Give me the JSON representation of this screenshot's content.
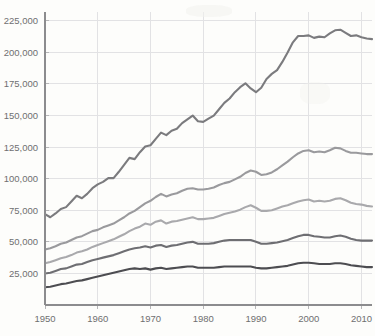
{
  "chart_data": {
    "type": "line",
    "title": "",
    "subtitle": "",
    "xlabel": "",
    "ylabel": "",
    "xlim": [
      1950,
      2012
    ],
    "ylim": [
      0,
      232000
    ],
    "grid": true,
    "legend": "none",
    "xticks": [
      1950,
      1960,
      1970,
      1980,
      1990,
      2000,
      2010
    ],
    "xticklabels": [
      "1950",
      "1960",
      "1970",
      "1980",
      "1990",
      "2000",
      "2010"
    ],
    "yticks": [
      25000,
      50000,
      75000,
      100000,
      125000,
      150000,
      175000,
      200000,
      225000
    ],
    "yticklabels": [
      "25,000",
      "50,000",
      "75,000",
      "100,000",
      "125,000",
      "150,000",
      "175,000",
      "200,000",
      "225,000"
    ],
    "x": [
      1950,
      1951,
      1952,
      1953,
      1954,
      1955,
      1956,
      1957,
      1958,
      1959,
      1960,
      1961,
      1962,
      1963,
      1964,
      1965,
      1966,
      1967,
      1968,
      1969,
      1970,
      1971,
      1972,
      1973,
      1974,
      1975,
      1976,
      1977,
      1978,
      1979,
      1980,
      1981,
      1982,
      1983,
      1984,
      1985,
      1986,
      1987,
      1988,
      1989,
      1990,
      1991,
      1992,
      1993,
      1994,
      1995,
      1996,
      1997,
      1998,
      1999,
      2000,
      2001,
      2002,
      2003,
      2004,
      2005,
      2006,
      2007,
      2008,
      2009,
      2010,
      2011,
      2012
    ],
    "series": [
      {
        "name": "series-1",
        "color": "#7b7b7e",
        "values": [
          72000,
          69500,
          72500,
          76000,
          77500,
          82000,
          86500,
          84500,
          88000,
          92500,
          95500,
          97500,
          100500,
          100500,
          105500,
          111000,
          116500,
          115500,
          121000,
          125500,
          126500,
          131500,
          136500,
          134500,
          138000,
          139500,
          144000,
          147000,
          150000,
          145500,
          145000,
          147500,
          150000,
          155000,
          160000,
          163500,
          168500,
          172500,
          175500,
          171500,
          168500,
          172000,
          179000,
          183000,
          186000,
          192500,
          200000,
          208000,
          213000,
          213000,
          213500,
          211500,
          212500,
          212000,
          215000,
          217500,
          218000,
          215500,
          213000,
          213500,
          212000,
          211000,
          210500
        ]
      },
      {
        "name": "series-2",
        "color": "#9a9a9d",
        "values": [
          44000,
          45000,
          46500,
          48500,
          49500,
          51500,
          53500,
          54500,
          56500,
          58500,
          59500,
          61500,
          63000,
          64500,
          67000,
          69500,
          72500,
          74500,
          77500,
          80500,
          82500,
          85500,
          88000,
          86000,
          87500,
          88500,
          90500,
          92000,
          92500,
          91500,
          91500,
          92000,
          93000,
          95000,
          96500,
          97500,
          99500,
          101500,
          104500,
          106500,
          105500,
          103000,
          103500,
          105000,
          107500,
          110500,
          113500,
          117000,
          120000,
          122000,
          122500,
          121000,
          121500,
          121000,
          122500,
          124500,
          124000,
          122000,
          120500,
          120500,
          120000,
          119500,
          119500
        ]
      },
      {
        "name": "series-3",
        "color": "#a9a9ac",
        "values": [
          33000,
          34000,
          35500,
          37000,
          38000,
          39500,
          41500,
          42500,
          44000,
          46000,
          47500,
          49000,
          50500,
          52000,
          54000,
          56000,
          58500,
          60500,
          62000,
          64500,
          63500,
          66000,
          67000,
          64500,
          66000,
          66500,
          67500,
          68500,
          69500,
          68000,
          68000,
          68500,
          69000,
          70500,
          72000,
          73000,
          74000,
          75500,
          77500,
          79000,
          77000,
          74500,
          74500,
          75000,
          76500,
          78000,
          79000,
          80500,
          82000,
          83000,
          83500,
          82000,
          82500,
          82000,
          82500,
          84000,
          84500,
          83000,
          81000,
          80000,
          79500,
          78500,
          78000
        ]
      },
      {
        "name": "series-4",
        "color": "#6e6e72",
        "values": [
          25000,
          25500,
          27000,
          28500,
          29000,
          30500,
          32000,
          32500,
          34000,
          35500,
          36500,
          37500,
          38500,
          39500,
          41000,
          42500,
          44000,
          45000,
          45500,
          46500,
          45500,
          47000,
          47500,
          46000,
          47000,
          47500,
          48500,
          49500,
          50000,
          48500,
          48500,
          48500,
          49000,
          50000,
          51000,
          51500,
          51500,
          51500,
          51500,
          51500,
          50000,
          48500,
          48500,
          49000,
          49500,
          50500,
          51500,
          53000,
          54500,
          55500,
          55500,
          54500,
          54000,
          53500,
          53500,
          54500,
          55000,
          54000,
          52500,
          51500,
          51000,
          51000,
          51000
        ]
      },
      {
        "name": "series-5",
        "color": "#4d4d51",
        "values": [
          14000,
          14500,
          15500,
          16500,
          17000,
          18000,
          19000,
          19500,
          20500,
          21500,
          22500,
          23500,
          24500,
          25500,
          26500,
          27500,
          28500,
          29000,
          28500,
          29000,
          28000,
          29000,
          29500,
          28500,
          29000,
          29500,
          30000,
          30500,
          30500,
          29500,
          29500,
          29500,
          29500,
          30000,
          30500,
          30500,
          30500,
          30500,
          30500,
          30500,
          29500,
          29000,
          29000,
          29500,
          30000,
          30500,
          31000,
          32000,
          33000,
          33500,
          33500,
          33000,
          32500,
          32500,
          32500,
          33000,
          33000,
          32500,
          31500,
          31000,
          30500,
          30000,
          30000
        ]
      }
    ]
  },
  "axis": {
    "axis_color": "#8c8c8e",
    "grid_color": "#e2e2e4",
    "tick_label_color": "#6f6f70",
    "background_color": "#fdfdfb"
  }
}
